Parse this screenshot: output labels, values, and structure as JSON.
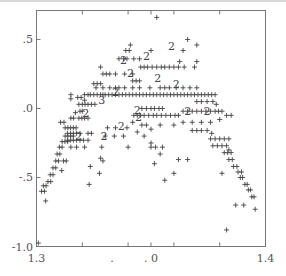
{
  "chart_data": {
    "type": "scatter",
    "title": "",
    "xlabel": "",
    "ylabel": "",
    "xlim": [
      1.3,
      1.4
    ],
    "ylim": [
      -1.0,
      0.71
    ],
    "grid": false,
    "legend": null,
    "x_tick_labels": [
      {
        "text": "1.3",
        "pos": 1.3
      },
      {
        "text": ".",
        "pos": 1.333
      },
      {
        "text": ". 0",
        "pos": 1.35
      },
      {
        "text": "1.4",
        "pos": 1.4
      }
    ],
    "y_tick_labels": [
      {
        "text": ".5",
        "pos": 0.5
      },
      {
        "text": ".0",
        "pos": 0.0
      },
      {
        "text": "-.5",
        "pos": -0.5
      },
      {
        "text": "-1.0",
        "pos": -1.0
      }
    ],
    "marker": "+",
    "overplot_note": "digits 2/3 indicate overlapping points",
    "points": [
      [
        1.3008,
        -0.975
      ],
      [
        1.3022,
        -0.6
      ],
      [
        1.3035,
        -0.6
      ],
      [
        1.303,
        -0.56
      ],
      [
        1.3042,
        -0.56
      ],
      [
        1.304,
        -0.67
      ],
      [
        1.305,
        -0.53
      ],
      [
        1.3062,
        -0.53
      ],
      [
        1.306,
        -0.48
      ],
      [
        1.3072,
        -0.48
      ],
      [
        1.3072,
        -0.43
      ],
      [
        1.3084,
        -0.43
      ],
      [
        1.3084,
        -0.38
      ],
      [
        1.3096,
        -0.38
      ],
      [
        1.309,
        -0.33
      ],
      [
        1.3102,
        -0.33
      ],
      [
        1.31,
        -0.28
      ],
      [
        1.3112,
        -0.28
      ],
      [
        1.3112,
        -0.24
      ],
      [
        1.3124,
        -0.24
      ],
      [
        1.3136,
        -0.24
      ],
      [
        1.3118,
        -0.38
      ],
      [
        1.313,
        -0.38
      ],
      [
        1.311,
        -0.45
      ],
      [
        1.3125,
        -0.2
      ],
      [
        1.3137,
        -0.2
      ],
      [
        1.3149,
        -0.2
      ],
      [
        1.3161,
        -0.2
      ],
      [
        1.3125,
        -0.14
      ],
      [
        1.3137,
        -0.14
      ],
      [
        1.3149,
        -0.14
      ],
      [
        1.3161,
        -0.14
      ],
      [
        1.3173,
        -0.14
      ],
      [
        1.3105,
        -0.1
      ],
      [
        1.312,
        -0.1
      ],
      [
        1.3135,
        -0.18
      ],
      [
        1.3149,
        -0.18
      ],
      [
        1.3161,
        -0.18
      ],
      [
        1.3175,
        -0.18
      ],
      [
        1.319,
        -0.18
      ],
      [
        1.3135,
        -0.23
      ],
      [
        1.3149,
        -0.23
      ],
      [
        1.3161,
        -0.23
      ],
      [
        1.3175,
        -0.23
      ],
      [
        1.319,
        -0.23
      ],
      [
        1.3205,
        -0.23
      ],
      [
        1.315,
        -0.28
      ],
      [
        1.3175,
        -0.28
      ],
      [
        1.321,
        -0.28
      ],
      [
        1.3225,
        -0.23
      ],
      [
        1.3225,
        -0.18
      ],
      [
        1.324,
        -0.18
      ],
      [
        1.315,
        -0.07
      ],
      [
        1.3162,
        -0.07
      ],
      [
        1.317,
        -0.03
      ],
      [
        1.3185,
        -0.07
      ],
      [
        1.3198,
        -0.07
      ],
      [
        1.321,
        -0.07
      ],
      [
        1.3225,
        -0.07
      ],
      [
        1.319,
        -0.02
      ],
      [
        1.32,
        -0.02
      ],
      [
        1.3185,
        0.03
      ],
      [
        1.32,
        0.03
      ],
      [
        1.3212,
        0.03
      ],
      [
        1.3225,
        0.03
      ],
      [
        1.324,
        0.03
      ],
      [
        1.3255,
        0.03
      ],
      [
        1.318,
        0.08
      ],
      [
        1.3195,
        0.08
      ],
      [
        1.321,
        0.06
      ],
      [
        1.315,
        0.07
      ],
      [
        1.315,
        0.1
      ],
      [
        1.321,
        0.1
      ],
      [
        1.3225,
        0.1
      ],
      [
        1.3235,
        0.1
      ],
      [
        1.325,
        0.1
      ],
      [
        1.3265,
        0.1
      ],
      [
        1.328,
        0.1
      ],
      [
        1.329,
        0.1
      ],
      [
        1.33,
        0.1
      ],
      [
        1.3315,
        0.1
      ],
      [
        1.333,
        0.1
      ],
      [
        1.3345,
        0.1
      ],
      [
        1.336,
        0.1
      ],
      [
        1.3375,
        0.1
      ],
      [
        1.339,
        0.1
      ],
      [
        1.3405,
        0.1
      ],
      [
        1.342,
        0.1
      ],
      [
        1.3435,
        0.1
      ],
      [
        1.345,
        0.1
      ],
      [
        1.3465,
        0.1
      ],
      [
        1.348,
        0.1
      ],
      [
        1.3495,
        0.1
      ],
      [
        1.351,
        0.1
      ],
      [
        1.3525,
        0.1
      ],
      [
        1.354,
        0.1
      ],
      [
        1.3555,
        0.1
      ],
      [
        1.357,
        0.1
      ],
      [
        1.3585,
        0.1
      ],
      [
        1.36,
        0.1
      ],
      [
        1.3615,
        0.1
      ],
      [
        1.363,
        0.1
      ],
      [
        1.3645,
        0.1
      ],
      [
        1.366,
        0.1
      ],
      [
        1.3675,
        0.1
      ],
      [
        1.369,
        0.1
      ],
      [
        1.3705,
        0.1
      ],
      [
        1.372,
        0.1
      ],
      [
        1.3735,
        0.1
      ],
      [
        1.375,
        0.1
      ],
      [
        1.3765,
        0.1
      ],
      [
        1.378,
        0.1
      ],
      [
        1.326,
        0.15
      ],
      [
        1.329,
        0.15
      ],
      [
        1.332,
        0.15
      ],
      [
        1.3345,
        0.15
      ],
      [
        1.336,
        0.15
      ],
      [
        1.3385,
        0.15
      ],
      [
        1.342,
        0.15
      ],
      [
        1.345,
        0.15
      ],
      [
        1.3495,
        0.15
      ],
      [
        1.354,
        0.15
      ],
      [
        1.356,
        0.15
      ],
      [
        1.358,
        0.15
      ],
      [
        1.361,
        0.15
      ],
      [
        1.364,
        0.15
      ],
      [
        1.367,
        0.15
      ],
      [
        1.37,
        0.15
      ],
      [
        1.325,
        0.18
      ],
      [
        1.3265,
        0.18
      ],
      [
        1.328,
        0.18
      ],
      [
        1.342,
        0.2
      ],
      [
        1.3435,
        0.2
      ],
      [
        1.345,
        0.2
      ],
      [
        1.329,
        0.25
      ],
      [
        1.3305,
        0.25
      ],
      [
        1.332,
        0.25
      ],
      [
        1.3345,
        0.25
      ],
      [
        1.3385,
        0.25
      ],
      [
        1.342,
        0.25
      ],
      [
        1.3455,
        0.3
      ],
      [
        1.347,
        0.3
      ],
      [
        1.3485,
        0.3
      ],
      [
        1.3505,
        0.3
      ],
      [
        1.3525,
        0.3
      ],
      [
        1.3545,
        0.3
      ],
      [
        1.356,
        0.3
      ],
      [
        1.358,
        0.3
      ],
      [
        1.36,
        0.3
      ],
      [
        1.362,
        0.3
      ],
      [
        1.3645,
        0.3
      ],
      [
        1.369,
        0.3
      ],
      [
        1.37,
        0.34
      ],
      [
        1.338,
        0.36
      ],
      [
        1.3395,
        0.36
      ],
      [
        1.3425,
        0.36
      ],
      [
        1.345,
        0.36
      ],
      [
        1.3625,
        0.34
      ],
      [
        1.339,
        0.42
      ],
      [
        1.3405,
        0.42
      ],
      [
        1.35,
        0.42
      ],
      [
        1.364,
        0.42
      ],
      [
        1.366,
        0.5
      ],
      [
        1.37,
        0.46
      ],
      [
        1.341,
        0.46
      ],
      [
        1.3525,
        0.66
      ],
      [
        1.336,
        0.36
      ],
      [
        1.328,
        0.3
      ],
      [
        1.3425,
        -0.05
      ],
      [
        1.344,
        -0.05
      ],
      [
        1.3455,
        -0.05
      ],
      [
        1.347,
        -0.05
      ],
      [
        1.349,
        -0.05
      ],
      [
        1.351,
        -0.05
      ],
      [
        1.3525,
        -0.05
      ],
      [
        1.3545,
        -0.05
      ],
      [
        1.3565,
        -0.05
      ],
      [
        1.3585,
        -0.05
      ],
      [
        1.3605,
        -0.05
      ],
      [
        1.362,
        -0.05
      ],
      [
        1.346,
        0.0
      ],
      [
        1.348,
        0.0
      ],
      [
        1.35,
        0.0
      ],
      [
        1.3515,
        0.0
      ],
      [
        1.3535,
        0.0
      ],
      [
        1.355,
        0.0
      ],
      [
        1.346,
        -0.12
      ],
      [
        1.348,
        -0.12
      ],
      [
        1.35,
        -0.15
      ],
      [
        1.354,
        -0.12
      ],
      [
        1.36,
        -0.12
      ],
      [
        1.364,
        -0.1
      ],
      [
        1.368,
        -0.1
      ],
      [
        1.372,
        -0.1
      ],
      [
        1.376,
        -0.1
      ],
      [
        1.38,
        -0.08
      ],
      [
        1.383,
        -0.05
      ],
      [
        1.385,
        -0.05
      ],
      [
        1.364,
        -0.02
      ],
      [
        1.366,
        -0.02
      ],
      [
        1.368,
        -0.02
      ],
      [
        1.37,
        -0.02
      ],
      [
        1.372,
        -0.02
      ],
      [
        1.374,
        -0.02
      ],
      [
        1.376,
        -0.02
      ],
      [
        1.378,
        -0.02
      ],
      [
        1.3795,
        -0.02
      ],
      [
        1.381,
        -0.02
      ],
      [
        1.37,
        0.05
      ],
      [
        1.372,
        0.05
      ],
      [
        1.3745,
        0.05
      ],
      [
        1.377,
        0.05
      ],
      [
        1.3785,
        0.03
      ],
      [
        1.368,
        -0.16
      ],
      [
        1.37,
        -0.16
      ],
      [
        1.372,
        -0.16
      ],
      [
        1.3745,
        -0.16
      ],
      [
        1.3765,
        -0.18
      ],
      [
        1.376,
        -0.22
      ],
      [
        1.378,
        -0.22
      ],
      [
        1.38,
        -0.22
      ],
      [
        1.382,
        -0.22
      ],
      [
        1.384,
        -0.22
      ],
      [
        1.377,
        -0.27
      ],
      [
        1.379,
        -0.27
      ],
      [
        1.381,
        -0.27
      ],
      [
        1.383,
        -0.27
      ],
      [
        1.382,
        -0.32
      ],
      [
        1.3835,
        -0.32
      ],
      [
        1.385,
        -0.32
      ],
      [
        1.384,
        -0.37
      ],
      [
        1.3855,
        -0.37
      ],
      [
        1.386,
        -0.42
      ],
      [
        1.3875,
        -0.42
      ],
      [
        1.388,
        -0.46
      ],
      [
        1.3895,
        -0.46
      ],
      [
        1.389,
        -0.5
      ],
      [
        1.39,
        -0.5
      ],
      [
        1.391,
        -0.55
      ],
      [
        1.392,
        -0.55
      ],
      [
        1.3925,
        -0.59
      ],
      [
        1.3935,
        -0.59
      ],
      [
        1.394,
        -0.64
      ],
      [
        1.395,
        -0.64
      ],
      [
        1.3955,
        -0.73
      ],
      [
        1.387,
        -0.7
      ],
      [
        1.3905,
        -0.7
      ],
      [
        1.383,
        -0.88
      ],
      [
        1.384,
        -0.3
      ],
      [
        1.381,
        -0.47
      ],
      [
        1.36,
        -0.47
      ],
      [
        1.354,
        -0.33
      ],
      [
        1.355,
        -0.28
      ],
      [
        1.362,
        -0.37
      ],
      [
        1.366,
        -0.37
      ],
      [
        1.328,
        -0.36
      ],
      [
        1.3235,
        -0.42
      ],
      [
        1.323,
        -0.55
      ],
      [
        1.3275,
        -0.47
      ],
      [
        1.329,
        -0.38
      ],
      [
        1.33,
        -0.2
      ],
      [
        1.331,
        -0.14
      ],
      [
        1.334,
        -0.2
      ],
      [
        1.3345,
        -0.14
      ],
      [
        1.338,
        -0.2
      ],
      [
        1.3395,
        -0.14
      ],
      [
        1.342,
        -0.1
      ],
      [
        1.344,
        -0.17
      ],
      [
        1.347,
        -0.2
      ],
      [
        1.35,
        -0.25
      ],
      [
        1.35,
        -0.28
      ],
      [
        1.352,
        -0.28
      ],
      [
        1.3515,
        -0.4
      ],
      [
        1.356,
        -0.52
      ],
      [
        1.3285,
        -0.28
      ],
      [
        1.34,
        -0.28
      ]
    ],
    "overplot_labels": [
      {
        "text": "3",
        "x": 1.3285,
        "y": 0.06
      },
      {
        "text": "2",
        "x": 1.3345,
        "y": 0.12
      },
      {
        "text": "2",
        "x": 1.3215,
        "y": -0.03
      },
      {
        "text": "2",
        "x": 1.3185,
        "y": -0.2
      },
      {
        "text": "2",
        "x": 1.3295,
        "y": -0.2
      },
      {
        "text": "2",
        "x": 1.337,
        "y": -0.13
      },
      {
        "text": "2",
        "x": 1.3445,
        "y": -0.06
      },
      {
        "text": "2",
        "x": 1.344,
        "y": -0.01
      },
      {
        "text": "2",
        "x": 1.338,
        "y": 0.35
      },
      {
        "text": "2",
        "x": 1.341,
        "y": 0.26
      },
      {
        "text": "2",
        "x": 1.348,
        "y": 0.38
      },
      {
        "text": "2",
        "x": 1.359,
        "y": 0.45
      },
      {
        "text": "2",
        "x": 1.353,
        "y": 0.22
      },
      {
        "text": "2",
        "x": 1.361,
        "y": 0.18
      },
      {
        "text": "2",
        "x": 1.366,
        "y": -0.02
      },
      {
        "text": "2",
        "x": 1.3745,
        "y": -0.02
      }
    ]
  },
  "colors": {
    "background": "#ffffff",
    "axis": "#777777",
    "marker": "#444444",
    "label": "#555555"
  }
}
